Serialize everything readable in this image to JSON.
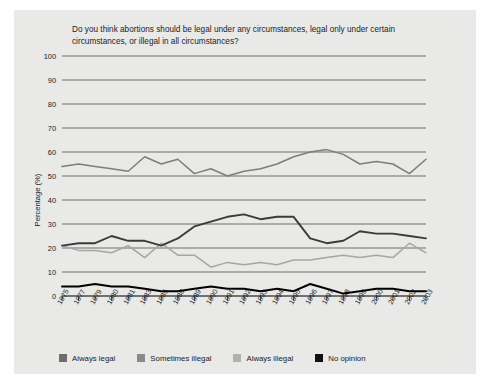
{
  "figure": {
    "background_color": "#e9e9e7",
    "page_color": "#ffffff"
  },
  "chart_data": {
    "type": "line",
    "title": "Do you think abortions should be legal under any circumstances, legal only under certain circumstances, or illegal in all circumstances?",
    "xlabel": "",
    "ylabel": "Percentage (%)",
    "ylim": [
      0,
      100
    ],
    "yticks": [
      0,
      10,
      20,
      30,
      40,
      50,
      60,
      70,
      80,
      90,
      100
    ],
    "grid": true,
    "legend_position": "bottom",
    "categories": [
      "1975",
      "1977",
      "1979",
      "1980",
      "1981",
      "1983",
      "1985",
      "1988",
      "1989",
      "1990",
      "1991",
      "1992",
      "1993",
      "1994",
      "1995",
      "1996",
      "1997",
      "1998",
      "1999",
      "2000",
      "2001",
      "2002",
      "2003"
    ],
    "series": [
      {
        "name": "Always legal",
        "color": "#3b3b3b",
        "values": [
          21,
          22,
          22,
          25,
          23,
          23,
          21,
          24,
          29,
          31,
          33,
          34,
          32,
          33,
          33,
          24,
          22,
          23,
          27,
          26,
          26,
          25,
          24
        ]
      },
      {
        "name": "Sometimes illegal",
        "color": "#7d7d7d",
        "values": [
          54,
          55,
          54,
          53,
          52,
          58,
          55,
          57,
          51,
          53,
          50,
          52,
          53,
          55,
          58,
          60,
          61,
          59,
          55,
          56,
          55,
          51,
          57
        ]
      },
      {
        "name": "Always illegal",
        "color": "#a6a6a6",
        "values": [
          21,
          19,
          19,
          18,
          21,
          16,
          22,
          17,
          17,
          12,
          14,
          13,
          14,
          13,
          15,
          15,
          16,
          17,
          16,
          17,
          16,
          22,
          18
        ]
      },
      {
        "name": "No opinion",
        "color": "#000000",
        "values": [
          4,
          4,
          5,
          4,
          4,
          3,
          2,
          2,
          3,
          4,
          3,
          3,
          2,
          3,
          2,
          5,
          3,
          1,
          2,
          3,
          3,
          2,
          2
        ]
      }
    ]
  },
  "legend": {
    "items": [
      {
        "label": "Always legal",
        "color": "#6e6e6e"
      },
      {
        "label": "Sometimes illegal",
        "color": "#8a8a8a"
      },
      {
        "label": "Always illegal",
        "color": "#b0b0b0"
      },
      {
        "label": "No opinion",
        "color": "#111111"
      }
    ]
  }
}
